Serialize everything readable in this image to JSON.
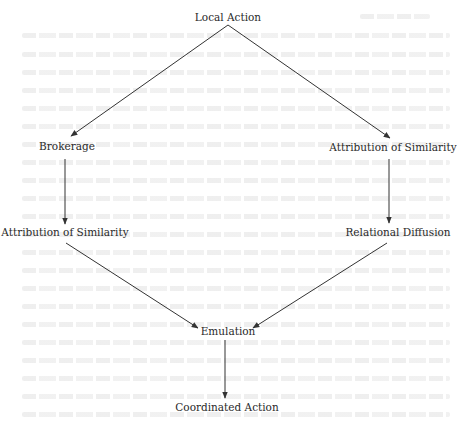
{
  "diagram": {
    "type": "flow",
    "nodes": [
      {
        "id": "local_action",
        "label": "Local Action",
        "x": 228,
        "y": 17
      },
      {
        "id": "brokerage",
        "label": "Brokerage",
        "x": 67,
        "y": 146
      },
      {
        "id": "attribution_right",
        "label": "Attribution of Similarity",
        "x": 405,
        "y": 147
      },
      {
        "id": "attribution_left",
        "label": "Attribution of Similarity",
        "x": 65,
        "y": 232
      },
      {
        "id": "relational_diffusion",
        "label": "Relational Diffusion",
        "x": 403,
        "y": 232
      },
      {
        "id": "emulation",
        "label": "Emulation",
        "x": 228,
        "y": 331
      },
      {
        "id": "coordinated_action",
        "label": "Coordinated Action",
        "x": 228,
        "y": 407
      }
    ],
    "edges": [
      {
        "from": "local_action",
        "to": "brokerage"
      },
      {
        "from": "local_action",
        "to": "attribution_right"
      },
      {
        "from": "brokerage",
        "to": "attribution_left"
      },
      {
        "from": "attribution_right",
        "to": "relational_diffusion"
      },
      {
        "from": "attribution_left",
        "to": "emulation"
      },
      {
        "from": "relational_diffusion",
        "to": "emulation"
      },
      {
        "from": "emulation",
        "to": "coordinated_action"
      }
    ]
  },
  "colors": {
    "line": "#333333",
    "text": "#2a2a2a",
    "background": "#ffffff",
    "bleed_through": "#ececec"
  }
}
